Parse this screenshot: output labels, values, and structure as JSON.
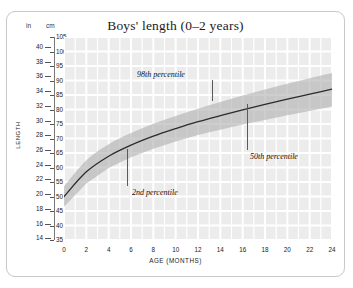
{
  "card": {
    "title": "Boys' length (0–2 years)"
  },
  "axes": {
    "left_unit_label": "in",
    "right_unit_label": "cm",
    "y_axis_title": "LENGTH",
    "x_axis_title": "AGE (MONTHS)",
    "inches_ticks": [
      40,
      38,
      36,
      34,
      32,
      30,
      28,
      26,
      24,
      22,
      20,
      18,
      16,
      14
    ],
    "cm_ticks": [
      105,
      100,
      95,
      90,
      85,
      80,
      75,
      70,
      65,
      60,
      55,
      50,
      45,
      40,
      35
    ],
    "x_ticks": [
      0,
      2,
      4,
      6,
      8,
      10,
      12,
      14,
      16,
      18,
      20,
      22,
      24
    ]
  },
  "annotations": [
    {
      "name": "p98",
      "label": "98th percentile"
    },
    {
      "name": "p50",
      "label": "50th percentile"
    },
    {
      "name": "p2",
      "label": "2nd percentile"
    }
  ],
  "colors": {
    "band": "#b0b0b0",
    "median_line": "#2b2b2b",
    "grid_cell": "#ececec",
    "grid_line": "#ffffff",
    "frame": "#c8c8c8",
    "text": "#1a1a1a"
  },
  "chart_data": {
    "type": "line",
    "title": "Boys' length (0–2 years)",
    "xlabel": "AGE (MONTHS)",
    "ylabel": "LENGTH",
    "x_unit": "months",
    "y_unit_primary": "cm",
    "y_unit_secondary": "in",
    "xlim": [
      0,
      24
    ],
    "ylim_cm": [
      35,
      105
    ],
    "ylim_in": [
      14,
      41
    ],
    "grid": true,
    "legend": "annotated-inline",
    "x": [
      0,
      2,
      4,
      6,
      8,
      10,
      12,
      14,
      16,
      18,
      20,
      22,
      24
    ],
    "series": [
      {
        "name": "2nd percentile",
        "values_cm": [
          46.5,
          54.5,
          59.8,
          63.5,
          66.5,
          69.0,
          71.2,
          73.0,
          74.8,
          76.4,
          78.0,
          79.5,
          81.0
        ]
      },
      {
        "name": "50th percentile",
        "values_cm": [
          50.0,
          58.5,
          63.9,
          67.7,
          70.8,
          73.4,
          75.8,
          77.9,
          79.9,
          81.8,
          83.6,
          85.3,
          87.0
        ]
      },
      {
        "name": "98th percentile",
        "values_cm": [
          53.5,
          62.5,
          68.0,
          71.9,
          75.1,
          77.8,
          80.3,
          82.6,
          84.8,
          86.9,
          88.9,
          90.8,
          92.6
        ]
      }
    ]
  }
}
